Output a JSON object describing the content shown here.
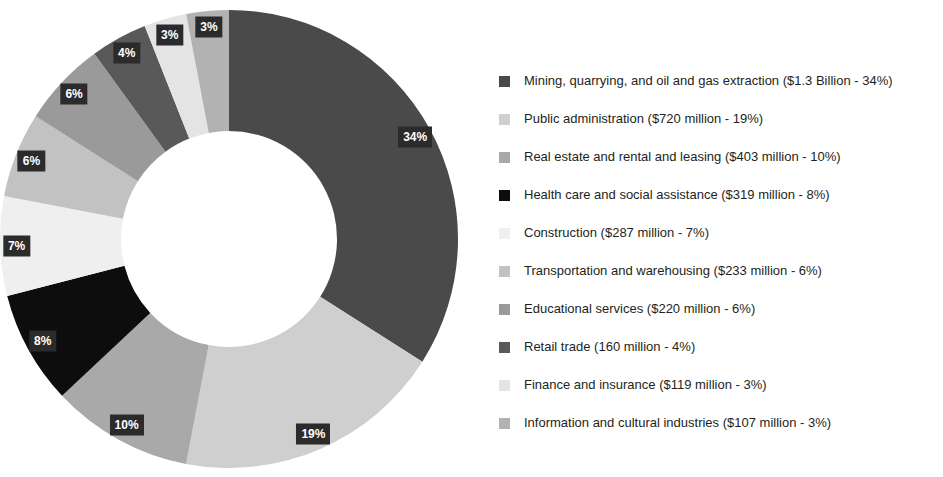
{
  "chart_data": {
    "type": "pie",
    "variant": "donut",
    "title": "",
    "subtitle": "",
    "xlabel": "",
    "ylabel": "",
    "legend_position": "right",
    "grid": false,
    "start_angle_deg": 0,
    "direction": "clockwise",
    "inner_radius_ratio": 0.47,
    "categories": [
      "Mining, quarrying, and oil and gas extraction",
      "Public administration",
      "Real estate and rental and leasing",
      "Health care and social assistance",
      "Construction",
      "Transportation and warehousing",
      "Educational services",
      "Retail trade",
      "Finance and insurance",
      "Information and cultural industries"
    ],
    "values": [
      34,
      19,
      10,
      8,
      7,
      6,
      6,
      4,
      3,
      3
    ],
    "value_labels": [
      "34%",
      "19%",
      "10%",
      "8%",
      "7%",
      "6%",
      "6%",
      "4%",
      "3%",
      "3%"
    ],
    "amounts": [
      "$1.3 Billion",
      "$720 million",
      "$403 million",
      "$319 million",
      "$287 million",
      "$233 million",
      "$220 million",
      "160 million",
      "$119 million",
      "$107 million"
    ],
    "colors": [
      "#4a4a4a",
      "#cfcfcf",
      "#a9a9a9",
      "#0d0d0d",
      "#efefef",
      "#c2c2c2",
      "#9a9a9a",
      "#595959",
      "#e4e4e4",
      "#b2b2b2"
    ],
    "label_box_color": "#2b2b2b",
    "label_text_color": "#ffffff",
    "legend": [
      {
        "label": "Mining, quarrying, and oil and gas extraction ($1.3 Billion - 34%)",
        "color": "#4a4a4a"
      },
      {
        "label": "Public administration ($720 million - 19%)",
        "color": "#cfcfcf"
      },
      {
        "label": "Real estate and rental and leasing ($403 million - 10%)",
        "color": "#a9a9a9"
      },
      {
        "label": "Health care and social assistance ($319 million - 8%)",
        "color": "#0d0d0d"
      },
      {
        "label": "Construction ($287 million - 7%)",
        "color": "#efefef"
      },
      {
        "label": "Transportation and warehousing ($233 million - 6%)",
        "color": "#c2c2c2"
      },
      {
        "label": " Educational services ($220 million - 6%)",
        "color": "#9a9a9a"
      },
      {
        "label": "Retail trade (160 million - 4%)",
        "color": "#595959"
      },
      {
        "label": "Finance and insurance ($119 million - 3%)",
        "color": "#e4e4e4"
      },
      {
        "label": "Information and cultural industries ($107 million - 3%)",
        "color": "#b2b2b2"
      }
    ]
  }
}
